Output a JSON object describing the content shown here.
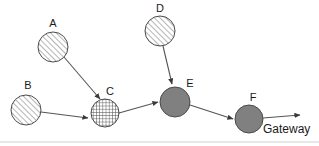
{
  "diagram": {
    "canvas": {
      "width": 319,
      "height": 146,
      "background": "#ffffff"
    },
    "styles": {
      "hatch_fill": "#ffffff",
      "hatch_stroke": "#777777",
      "solid_fill": "#808080",
      "node_stroke": "#4a4a4a",
      "edge_stroke": "#555555",
      "label_color": "#1a1a1a",
      "frame_color": "#cfcfcf"
    },
    "nodes": [
      {
        "id": "A",
        "label": "A",
        "cx": 53,
        "cy": 47,
        "r": 15,
        "fill_style": "diagonal-hatch",
        "label_x": 53,
        "label_y": 27
      },
      {
        "id": "B",
        "label": "B",
        "cx": 26,
        "cy": 110,
        "r": 15,
        "fill_style": "diagonal-hatch",
        "label_x": 28,
        "label_y": 89
      },
      {
        "id": "C",
        "label": "C",
        "cx": 105,
        "cy": 113,
        "r": 14,
        "fill_style": "cross-hatch",
        "label_x": 110,
        "label_y": 95
      },
      {
        "id": "D",
        "label": "D",
        "cx": 160,
        "cy": 31,
        "r": 15,
        "fill_style": "diagonal-hatch",
        "label_x": 160,
        "label_y": 12
      },
      {
        "id": "E",
        "label": "E",
        "cx": 175,
        "cy": 102,
        "r": 15,
        "fill_style": "solid-gray",
        "label_x": 190,
        "label_y": 87
      },
      {
        "id": "F",
        "label": "F",
        "cx": 249,
        "cy": 119,
        "r": 14,
        "fill_style": "solid-gray",
        "label_x": 253,
        "label_y": 101
      }
    ],
    "edges": [
      {
        "id": "A-C",
        "from": "A",
        "to": "C",
        "x1": 64,
        "y1": 57,
        "x2": 100,
        "y2": 99,
        "arrow": true
      },
      {
        "id": "B-C",
        "from": "B",
        "to": "C",
        "x1": 41,
        "y1": 112,
        "x2": 88,
        "y2": 118,
        "arrow": true
      },
      {
        "id": "D-E",
        "from": "D",
        "to": "E",
        "x1": 163,
        "y1": 46,
        "x2": 172,
        "y2": 84,
        "arrow": true
      },
      {
        "id": "C-E",
        "from": "C",
        "to": "E",
        "x1": 119,
        "y1": 113,
        "x2": 158,
        "y2": 102,
        "arrow": true
      },
      {
        "id": "E-F",
        "from": "E",
        "to": "F",
        "x1": 190,
        "y1": 105,
        "x2": 233,
        "y2": 119,
        "arrow": true
      },
      {
        "id": "F-Gateway",
        "from": "F",
        "to": "Gateway",
        "x1": 263,
        "y1": 118,
        "x2": 300,
        "y2": 115,
        "arrow": true
      }
    ],
    "annotations": [
      {
        "id": "gateway",
        "text": "Gateway",
        "x": 263,
        "y": 133
      }
    ],
    "frame": {
      "visible": true,
      "y": 142
    }
  }
}
